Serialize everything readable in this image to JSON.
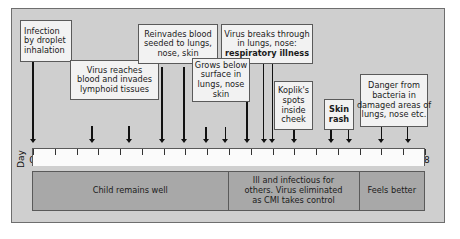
{
  "figure": {
    "axis": {
      "label": "Day",
      "ticks": [
        "0",
        "1",
        "2",
        "3",
        "4",
        "5",
        "6",
        "7",
        "8",
        "9",
        "10",
        "11",
        "12",
        "13",
        "14",
        "15",
        "16",
        "17",
        "18"
      ],
      "min": 0,
      "max": 18
    },
    "colors": {
      "background": "#cfcfcf",
      "box_fill": "#f2f2f2",
      "box_border": "#5a5a5a",
      "bar_fill": "#a8a8a8",
      "axis_fill": "#fbfbfb",
      "line": "#111111"
    },
    "callouts": [
      {
        "id": "infection",
        "lines": [
          "Infection",
          "by droplet",
          "inhalation"
        ],
        "align": "left",
        "day": 0
      },
      {
        "id": "virus-reaches-blood",
        "lines": [
          "Virus reaches",
          "blood and invades",
          "lymphoid tissues"
        ],
        "align": "center",
        "days": [
          2.7,
          4.4
        ]
      },
      {
        "id": "reinvades-blood",
        "lines": [
          "Reinvades blood",
          "seeded to lungs,",
          "nose, skin"
        ],
        "align": "center",
        "days": [
          6.0,
          7.0
        ]
      },
      {
        "id": "virus-breaks-through",
        "lines": [
          "Virus breaks through",
          "in lungs, nose:",
          "respiratory illness"
        ],
        "align": "center",
        "days": [
          10.75,
          11.15
        ]
      },
      {
        "id": "grows-below-surface",
        "lines": [
          "Grows below",
          "surface in",
          "lungs, nose",
          "skin"
        ],
        "align": "center",
        "days": [
          8.1,
          9.0,
          10.0
        ]
      },
      {
        "id": "kopliks-spots",
        "lines": [
          "Koplik's",
          "spots",
          "inside",
          "cheek"
        ],
        "align": "center",
        "days": [
          12.0
        ]
      },
      {
        "id": "skin-rash",
        "lines": [
          "Skin",
          "rash"
        ],
        "align": "center",
        "days": [
          13.7,
          14.5
        ]
      },
      {
        "id": "danger-bacteria",
        "lines": [
          "Danger from",
          "bacteria in",
          "damaged areas of",
          "lungs, nose etc."
        ],
        "align": "center",
        "days": [
          16.0,
          17.2
        ]
      }
    ],
    "segments": [
      {
        "id": "child-remains-well",
        "lines": [
          "Child remains well"
        ],
        "start_day": 0,
        "end_day": 9
      },
      {
        "id": "ill-and-infectious",
        "lines": [
          "Ill and infectious for",
          "others. Virus eliminated",
          "as CMI takes control"
        ],
        "start_day": 9,
        "end_day": 15
      },
      {
        "id": "feels-better",
        "lines": [
          "Feels better"
        ],
        "start_day": 15,
        "end_day": 18
      }
    ]
  },
  "chart_data": {
    "type": "timeline",
    "xlabel": "Day",
    "xlim": [
      0,
      18
    ],
    "xticks": [
      0,
      1,
      2,
      3,
      4,
      5,
      6,
      7,
      8,
      9,
      10,
      11,
      12,
      13,
      14,
      15,
      16,
      17,
      18
    ],
    "annotations": [
      {
        "label": "Infection by droplet inhalation",
        "days": [
          0
        ]
      },
      {
        "label": "Virus reaches blood and invades lymphoid tissues",
        "days": [
          2.7,
          4.4
        ]
      },
      {
        "label": "Reinvades blood seeded to lungs, nose, skin",
        "days": [
          6.0,
          7.0
        ]
      },
      {
        "label": "Grows below surface in lungs, nose skin",
        "days": [
          8.1,
          9.0,
          10.0
        ]
      },
      {
        "label": "Virus breaks through in lungs, nose: respiratory illness",
        "days": [
          10.75,
          11.15
        ]
      },
      {
        "label": "Koplik's spots inside cheek",
        "days": [
          12.0
        ]
      },
      {
        "label": "Skin rash",
        "days": [
          13.7,
          14.5
        ]
      },
      {
        "label": "Danger from bacteria in damaged areas of lungs, nose etc.",
        "days": [
          16.0,
          17.2
        ]
      }
    ],
    "phases": [
      {
        "label": "Child remains well",
        "start": 0,
        "end": 9
      },
      {
        "label": "Ill and infectious for others. Virus eliminated as CMI takes control",
        "start": 9,
        "end": 15
      },
      {
        "label": "Feels better",
        "start": 15,
        "end": 18
      }
    ]
  }
}
